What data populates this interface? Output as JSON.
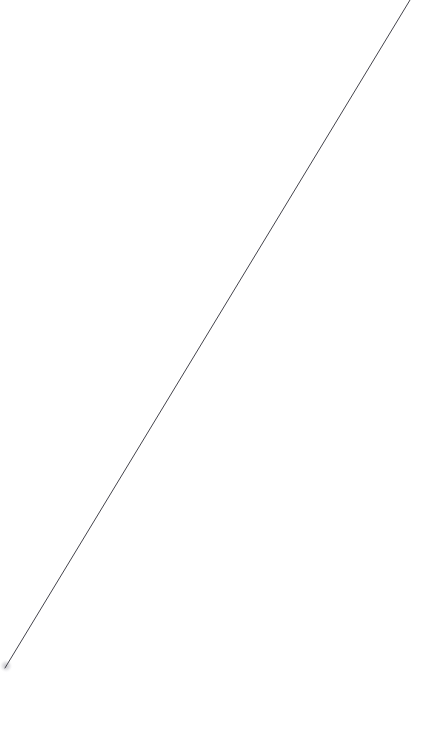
{
  "canvas": {
    "width": 422,
    "height": 737,
    "background_color": "#ffffff",
    "description": "blank white page with a single thin diagonal line"
  },
  "figure": {
    "name": "diagonal-line",
    "type": "line-segment",
    "stroke_color": "#44444c",
    "stroke_width": 1,
    "start": {
      "x": 410,
      "y": 0
    },
    "end": {
      "x": 5,
      "y": 668
    },
    "endpoint_blur": {
      "x": 6,
      "y": 666,
      "radius": 7,
      "color": "#9a9aa2",
      "opacity": 0.55
    }
  },
  "chart_data": {
    "type": "line",
    "title": "",
    "subtitle": "",
    "xlabel": "",
    "ylabel": "",
    "grid": false,
    "legend": null,
    "axes_visible": false,
    "tick_labels": {
      "x": [],
      "y": []
    },
    "xlim": [
      0,
      422
    ],
    "ylim": [
      0,
      737
    ],
    "annotations": [],
    "series": [
      {
        "name": "diagonal",
        "color": "#44444c",
        "x": [
          410,
          5
        ],
        "y": [
          0,
          668
        ]
      }
    ]
  }
}
